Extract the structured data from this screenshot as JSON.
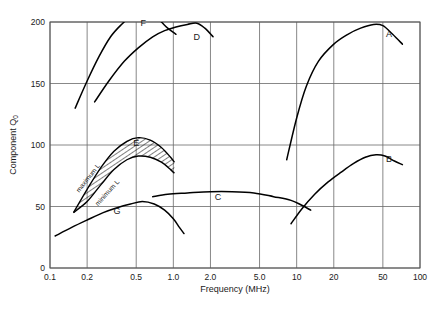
{
  "chart_data": {
    "type": "line",
    "title": "",
    "xlabel": "Frequency   (MHz)",
    "ylabel": "Component Q",
    "ylabel_sub": "0",
    "xscale": "log",
    "yscale": "linear",
    "xlim": [
      0.1,
      100
    ],
    "ylim": [
      0,
      200
    ],
    "grid": true,
    "legend_position": "inline-labels",
    "xticks": [
      0.1,
      0.2,
      0.5,
      1.0,
      2.0,
      5.0,
      10,
      20,
      50,
      100
    ],
    "xticklabels": [
      "0.1",
      "0.2",
      "0.5",
      "1.0",
      "2.0",
      "5.0",
      "10",
      "20",
      "50",
      "100"
    ],
    "yticks": [
      0,
      50,
      100,
      150,
      200
    ],
    "yticklabels": [
      "0",
      "50",
      "100",
      "150",
      "200"
    ],
    "annotations": [
      {
        "text": "maximum L",
        "x": 0.21,
        "y": 72,
        "rotation": -52
      },
      {
        "text": "minimum L",
        "x": 0.3,
        "y": 60,
        "rotation": -48
      }
    ],
    "band": {
      "label": "E",
      "fill": "hatched",
      "upper_name": "maximum L",
      "lower_name": "minimum L",
      "upper": [
        [
          0.155,
          45
        ],
        [
          0.2,
          64
        ],
        [
          0.26,
          82
        ],
        [
          0.33,
          95
        ],
        [
          0.42,
          103
        ],
        [
          0.52,
          106
        ],
        [
          0.65,
          104
        ],
        [
          0.8,
          98
        ],
        [
          0.95,
          90
        ],
        [
          1.02,
          86
        ]
      ],
      "lower": [
        [
          0.155,
          45
        ],
        [
          0.2,
          54
        ],
        [
          0.26,
          68
        ],
        [
          0.33,
          80
        ],
        [
          0.42,
          88
        ],
        [
          0.52,
          91
        ],
        [
          0.65,
          90
        ],
        [
          0.8,
          86
        ],
        [
          0.95,
          80
        ],
        [
          1.02,
          77
        ]
      ]
    },
    "series": [
      {
        "name": "A",
        "label": "A",
        "label_x": 56,
        "label_y": 188,
        "points": [
          [
            8.3,
            88
          ],
          [
            10,
            122
          ],
          [
            12,
            148
          ],
          [
            15,
            168
          ],
          [
            20,
            182
          ],
          [
            26,
            190
          ],
          [
            33,
            195
          ],
          [
            42,
            198
          ],
          [
            50,
            197
          ],
          [
            60,
            190
          ],
          [
            72,
            182
          ]
        ]
      },
      {
        "name": "B",
        "label": "B",
        "label_x": 56,
        "label_y": 86,
        "points": [
          [
            9.0,
            36
          ],
          [
            11,
            48
          ],
          [
            14,
            60
          ],
          [
            18,
            70
          ],
          [
            23,
            78
          ],
          [
            29,
            85
          ],
          [
            36,
            90
          ],
          [
            44,
            92
          ],
          [
            52,
            91
          ],
          [
            62,
            87
          ],
          [
            72,
            84
          ]
        ]
      },
      {
        "name": "C",
        "label": "C",
        "label_x": 2.3,
        "label_y": 55,
        "points": [
          [
            0.68,
            58
          ],
          [
            0.9,
            60
          ],
          [
            1.3,
            61
          ],
          [
            2.0,
            62
          ],
          [
            3.0,
            62
          ],
          [
            4.5,
            61
          ],
          [
            6.5,
            58
          ],
          [
            9.0,
            55
          ],
          [
            11,
            51
          ],
          [
            13,
            47
          ]
        ]
      },
      {
        "name": "D",
        "label": "D",
        "label_x": 1.55,
        "label_y": 185,
        "points": [
          [
            0.23,
            135
          ],
          [
            0.3,
            152
          ],
          [
            0.4,
            168
          ],
          [
            0.52,
            179
          ],
          [
            0.68,
            188
          ],
          [
            0.85,
            193
          ],
          [
            1.05,
            196
          ],
          [
            1.3,
            198
          ],
          [
            1.55,
            199
          ],
          [
            1.8,
            195
          ],
          [
            2.1,
            188
          ]
        ]
      },
      {
        "name": "E",
        "label": "E",
        "label_x": 0.5,
        "label_y": 99,
        "points": []
      },
      {
        "name": "F",
        "label": "F",
        "label_x": 0.57,
        "label_y": 197,
        "points": [
          [
            0.16,
            130
          ],
          [
            0.2,
            152
          ],
          [
            0.25,
            172
          ],
          [
            0.31,
            188
          ],
          [
            0.38,
            198
          ],
          [
            0.46,
            205
          ],
          [
            0.55,
            208
          ],
          [
            0.66,
            206
          ],
          [
            0.78,
            201
          ],
          [
            0.9,
            195
          ],
          [
            1.05,
            190
          ]
        ]
      },
      {
        "name": "G",
        "label": "G",
        "label_x": 0.35,
        "label_y": 44,
        "points": [
          [
            0.11,
            26
          ],
          [
            0.15,
            33
          ],
          [
            0.2,
            39
          ],
          [
            0.27,
            45
          ],
          [
            0.35,
            49
          ],
          [
            0.45,
            52
          ],
          [
            0.56,
            54
          ],
          [
            0.7,
            52
          ],
          [
            0.85,
            47
          ],
          [
            1.0,
            40
          ],
          [
            1.12,
            33
          ],
          [
            1.22,
            28
          ]
        ]
      }
    ]
  }
}
